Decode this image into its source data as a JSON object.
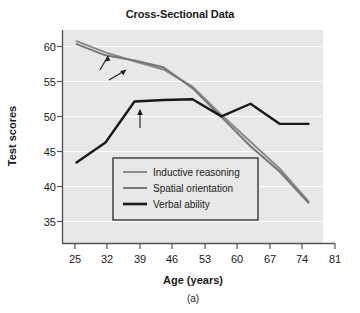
{
  "chart_data": {
    "type": "line",
    "title": "Cross-Sectional Data",
    "xlabel": "Age (years)",
    "ylabel": "Test scores",
    "caption": "(a)",
    "x": [
      25,
      32,
      39,
      46,
      53,
      60,
      67,
      74,
      81
    ],
    "xticks": [
      "25",
      "32",
      "39",
      "46",
      "53",
      "60",
      "67",
      "74",
      "81"
    ],
    "yticks": [
      "35",
      "40",
      "45",
      "50",
      "55",
      "60"
    ],
    "xlim": [
      21.5,
      84.5
    ],
    "ylim": [
      33.0,
      61.6
    ],
    "grid": "horizontal",
    "legend_position": "lower-center-left",
    "plot_background": "#e8e8e8",
    "gridline_color": "#ffffff",
    "series": [
      {
        "name": "Inductive reasoning",
        "color": "#8a8a8a",
        "width": 2.0,
        "values": [
          60.1,
          58.6,
          57.4,
          56.3,
          54.0,
          50.2,
          46.6,
          43.0,
          38.6
        ]
      },
      {
        "name": "Spatial orientation",
        "color": "#777777",
        "width": 2.0,
        "values": [
          59.7,
          58.2,
          57.5,
          56.6,
          53.8,
          49.9,
          46.0,
          42.6,
          38.4
        ]
      },
      {
        "name": "Verbal ability",
        "color": "#1a1a1a",
        "width": 2.4,
        "values": [
          43.8,
          46.5,
          52.0,
          52.2,
          52.3,
          50.0,
          51.7,
          49.0,
          49.0
        ]
      }
    ],
    "annotations": [
      {
        "text": "Fluid\nintelligence",
        "targets": [
          "Inductive reasoning",
          "Spatial orientation"
        ]
      },
      {
        "text": "Crystallized\nintelligence",
        "targets": [
          "Verbal ability"
        ]
      }
    ]
  },
  "legend": {
    "items": [
      {
        "label": "Inductive reasoning",
        "color": "#8a8a8a"
      },
      {
        "label": "Spatial orientation",
        "color": "#777777"
      },
      {
        "label": "Verbal ability",
        "color": "#1a1a1a"
      }
    ]
  },
  "annotation_text": {
    "fluid_line1": "Fluid",
    "fluid_line2": "intelligence",
    "crystallized_line1": "Crystallized",
    "crystallized_line2": "intelligence"
  }
}
